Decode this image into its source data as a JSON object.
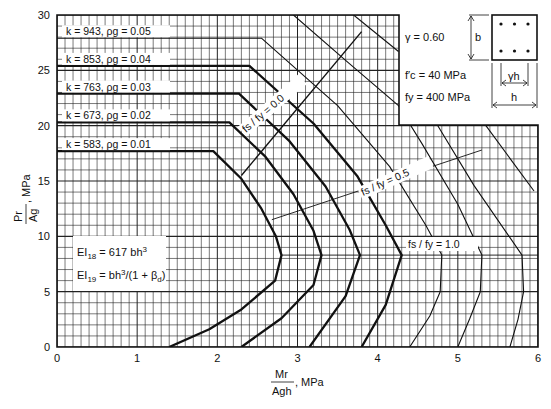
{
  "chart_data": {
    "type": "line",
    "title": "",
    "xlabel": "Mr / (Ag h), MPa",
    "ylabel": "Pr / Ag, MPa",
    "xlim": [
      0,
      6
    ],
    "ylim": [
      0,
      30
    ],
    "x_ticks": [
      "0",
      "1",
      "2",
      "3",
      "4",
      "5",
      "6"
    ],
    "y_ticks": [
      "0",
      "5",
      "10",
      "15",
      "20",
      "25",
      "30"
    ],
    "grid": true,
    "grid_minor": {
      "x_step": 0.1,
      "y_step": 1
    },
    "series": [
      {
        "name": "k = 583, ρg = 0.01",
        "weight": "bold",
        "points": [
          [
            0,
            17.7
          ],
          [
            1.95,
            17.7
          ],
          [
            2.3,
            15.2
          ],
          [
            2.55,
            12.5
          ],
          [
            2.73,
            10.0
          ],
          [
            2.8,
            8.3
          ],
          [
            2.72,
            6.0
          ],
          [
            2.3,
            3.4
          ],
          [
            1.9,
            1.6
          ],
          [
            1.4,
            0
          ]
        ]
      },
      {
        "name": "k = 673, ρg = 0.02",
        "weight": "bold",
        "points": [
          [
            0,
            20.3
          ],
          [
            2.15,
            20.3
          ],
          [
            2.6,
            17.2
          ],
          [
            2.95,
            13.8
          ],
          [
            3.2,
            10.5
          ],
          [
            3.3,
            8.3
          ],
          [
            3.2,
            5.6
          ],
          [
            2.8,
            2.6
          ],
          [
            2.3,
            0
          ]
        ]
      },
      {
        "name": "k = 763, ρg = 0.03",
        "weight": "bold",
        "points": [
          [
            0,
            22.9
          ],
          [
            2.27,
            22.9
          ],
          [
            2.9,
            18.6
          ],
          [
            3.35,
            14.5
          ],
          [
            3.65,
            10.6
          ],
          [
            3.78,
            8.3
          ],
          [
            3.6,
            4.6
          ],
          [
            3.15,
            0
          ]
        ]
      },
      {
        "name": "k = 853, ρg = 0.04",
        "weight": "bold",
        "points": [
          [
            0,
            25.4
          ],
          [
            2.4,
            25.4
          ],
          [
            3.2,
            20.2
          ],
          [
            3.75,
            15.4
          ],
          [
            4.1,
            11.0
          ],
          [
            4.3,
            8.3
          ],
          [
            4.1,
            3.8
          ],
          [
            3.8,
            0
          ]
        ]
      },
      {
        "name": "k = 943, ρg = 0.05",
        "weight": "thin",
        "points": [
          [
            0,
            27.9
          ],
          [
            2.55,
            27.9
          ],
          [
            3.5,
            21.8
          ],
          [
            4.15,
            16.3
          ],
          [
            4.6,
            11.0
          ],
          [
            4.8,
            8.3
          ],
          [
            4.78,
            5.0
          ],
          [
            4.65,
            2.8
          ],
          [
            4.4,
            0
          ]
        ]
      },
      {
        "name": "thin-6",
        "weight": "thin",
        "points": [
          [
            2.95,
            30
          ],
          [
            3.6,
            25.9
          ],
          [
            4.26,
            21.8
          ],
          [
            4.55,
            18.4
          ],
          [
            5.0,
            12.9
          ],
          [
            5.3,
            8.3
          ],
          [
            5.28,
            5.0
          ],
          [
            5.15,
            2.6
          ],
          [
            5.0,
            0
          ]
        ]
      },
      {
        "name": "thin-7",
        "weight": "thin",
        "points": [
          [
            3.7,
            30
          ],
          [
            4.26,
            26.7
          ],
          [
            4.26,
            26.7
          ]
        ],
        "continued": [
          [
            4.75,
            20
          ],
          [
            5.2,
            14.6
          ],
          [
            5.8,
            8.3
          ],
          [
            5.82,
            5.0
          ],
          [
            5.75,
            2.5
          ],
          [
            5.65,
            0
          ]
        ]
      },
      {
        "name": "thin-8",
        "weight": "thin",
        "points": [
          [
            5.35,
            20
          ],
          [
            5.95,
            14.1
          ]
        ]
      }
    ],
    "strain_lines": [
      {
        "label": "fs / fy = 0.0",
        "points": [
          [
            2.3,
            15.5
          ],
          [
            3.8,
            28.5
          ]
        ]
      },
      {
        "label": "fs / fy = 0.5",
        "points": [
          [
            2.68,
            11.5
          ],
          [
            5.3,
            17.8
          ]
        ]
      },
      {
        "label": "fs / fy = 1.0",
        "points": [
          [
            2.8,
            8.3
          ],
          [
            6.0,
            8.3
          ]
        ]
      }
    ],
    "legend_labels": [
      {
        "k": "k = 943,",
        "rho": "ρg = 0.05"
      },
      {
        "k": "k = 853,",
        "rho": "ρg = 0.04"
      },
      {
        "k": "k = 763,",
        "rho": "ρg = 0.03"
      },
      {
        "k": "k = 673,",
        "rho": "ρg = 0.02"
      },
      {
        "k": "k = 583,",
        "rho": "ρg = 0.01"
      }
    ],
    "annotations": {
      "gamma": "γ  =  0.60",
      "fc": "f′c  =   40  MPa",
      "fy": "fy  =  400  MPa",
      "ei18": "EI18 = 617 bh³",
      "ei19": "EI19 = bh³/(1 + βd)",
      "section_b": "b",
      "section_gh": "γh",
      "section_h": "h"
    }
  },
  "axis": {
    "x_label_num": "Mr",
    "x_label_den": "Agh",
    "x_label_unit": ", MPa",
    "y_label_num": "Pr",
    "y_label_den": "Ag",
    "y_label_unit": ", MPa"
  }
}
